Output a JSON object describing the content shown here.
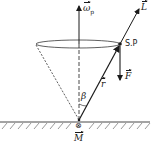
{
  "diagram": {
    "type": "precessing gyroscope / spinning top vector diagram",
    "labels": {
      "omega": "ω",
      "omega_sub": "p",
      "L": "L",
      "SP": "S.P",
      "F": "F",
      "r": "r",
      "beta": "β",
      "M": "M",
      "torque_symbol": "⊗"
    },
    "colors": {
      "line": "#1a1a1a",
      "background": "#ffffff"
    }
  }
}
